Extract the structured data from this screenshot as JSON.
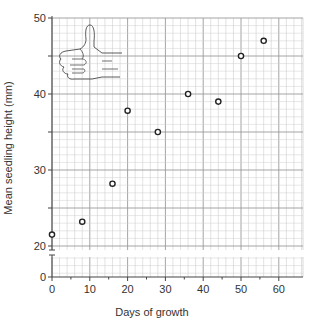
{
  "chart_data": {
    "type": "scatter",
    "title": "",
    "xlabel": "Days of growth",
    "ylabel": "Mean seedling height (mm)",
    "xlim": [
      0,
      65
    ],
    "ylim": [
      0,
      50
    ],
    "y_axis_break": [
      0,
      20
    ],
    "x_ticks": [
      0,
      10,
      20,
      30,
      40,
      50,
      60
    ],
    "y_ticks": [
      0,
      20,
      30,
      40,
      50
    ],
    "grid": true,
    "legend": null,
    "series": [
      {
        "name": "Mean seedling height",
        "marker": "open-circle",
        "x": [
          0,
          8,
          16,
          20,
          28,
          36,
          44,
          50,
          56
        ],
        "y": [
          21.5,
          23.2,
          28.2,
          37.8,
          35,
          40,
          39,
          45,
          47
        ]
      }
    ],
    "annotations": [
      "thumbs-up hand illustration (upper left of plot)"
    ]
  },
  "colors": {
    "grid_minor": "#cfcfcf",
    "grid_major": "#9a9a9a",
    "axis": "#444444",
    "marker": "#222222"
  }
}
